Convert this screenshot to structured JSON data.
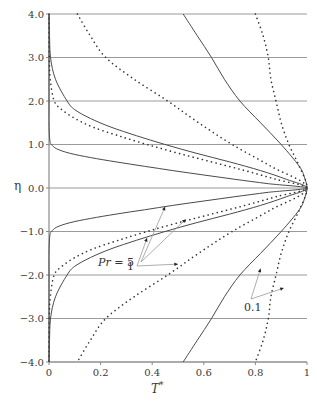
{
  "chart_data": {
    "type": "line",
    "title": "",
    "xlabel": "T*",
    "ylabel": "η",
    "xlim": [
      0,
      1
    ],
    "ylim": [
      -4.0,
      4.0
    ],
    "grid": "horizontal",
    "legend": "none (inline annotations)",
    "x_ticks": [
      "0",
      "0.2",
      "0.4",
      "0.6",
      "0.8",
      "1"
    ],
    "y_ticks": [
      "4.0",
      "3.0",
      "2.0",
      "1.0",
      "0.0",
      "-1.0",
      "-2.0",
      "-3.0",
      "-4.0"
    ],
    "symmetric_about_eta_zero": true,
    "series": [
      {
        "name": "Pr = 5 (solid)",
        "style": "solid",
        "eta_abs": [
          0,
          0.1,
          0.2,
          0.3,
          0.4,
          0.5,
          0.6,
          0.7,
          0.8,
          0.9,
          1.0,
          1.1,
          1.5,
          2.0,
          4.0
        ],
        "T": [
          1.0,
          0.85,
          0.72,
          0.6,
          0.48,
          0.37,
          0.26,
          0.16,
          0.08,
          0.03,
          0.01,
          0.003,
          0.0,
          0.0,
          0.0
        ]
      },
      {
        "name": "Pr = 5 (dotted)",
        "style": "dotted",
        "eta_abs": [
          0,
          0.2,
          0.4,
          0.6,
          0.8,
          1.0,
          1.2,
          1.4,
          1.6,
          1.8,
          2.0,
          2.5,
          3.0,
          4.0
        ],
        "T": [
          1.0,
          0.88,
          0.76,
          0.63,
          0.5,
          0.38,
          0.27,
          0.17,
          0.1,
          0.05,
          0.02,
          0.005,
          0.001,
          0.0
        ]
      },
      {
        "name": "Pr = 1 (solid)",
        "style": "solid",
        "eta_abs": [
          0,
          0.2,
          0.4,
          0.6,
          0.8,
          1.0,
          1.2,
          1.4,
          1.6,
          1.8,
          2.0,
          2.5,
          3.0,
          3.5,
          4.0
        ],
        "T": [
          1.0,
          0.92,
          0.82,
          0.7,
          0.57,
          0.45,
          0.34,
          0.24,
          0.16,
          0.1,
          0.07,
          0.025,
          0.006,
          0.002,
          0.0
        ]
      },
      {
        "name": "Pr = 1 (dotted)",
        "style": "dotted",
        "eta_abs": [
          0,
          0.5,
          1.0,
          1.5,
          2.0,
          2.5,
          3.0,
          3.5,
          4.0
        ],
        "T": [
          1.0,
          0.86,
          0.71,
          0.58,
          0.46,
          0.33,
          0.22,
          0.16,
          0.11
        ]
      },
      {
        "name": "Pr = 0.1 (solid)",
        "style": "solid",
        "eta_abs": [
          0,
          0.25,
          0.5,
          1.0,
          1.5,
          2.0,
          2.5,
          3.0,
          3.5,
          4.0
        ],
        "T": [
          1.0,
          0.99,
          0.97,
          0.9,
          0.82,
          0.74,
          0.68,
          0.63,
          0.575,
          0.52
        ]
      },
      {
        "name": "Pr = 0.1 (dotted)",
        "style": "dotted",
        "eta_abs": [
          0,
          0.5,
          1.0,
          1.5,
          2.0,
          2.5,
          3.0,
          3.5,
          4.0
        ],
        "T": [
          1.0,
          0.97,
          0.93,
          0.9,
          0.88,
          0.86,
          0.85,
          0.83,
          0.8
        ]
      }
    ],
    "annotations": [
      {
        "text": "Pr = 5",
        "label_pos": [
          0.31,
          -0.6
        ],
        "arrows_to": [
          [
            0.45,
            -0.43
          ],
          [
            0.53,
            -0.72
          ]
        ]
      },
      {
        "text": "1",
        "label_pos": [
          0.3,
          -1.75
        ],
        "arrows_to": [
          [
            0.38,
            -1.15
          ],
          [
            0.5,
            -1.75
          ]
        ]
      },
      {
        "text": "0.1",
        "label_pos": [
          0.8,
          -2.5
        ],
        "arrows_to": [
          [
            0.82,
            -1.85
          ],
          [
            0.91,
            -2.3
          ]
        ]
      }
    ]
  },
  "labels": {
    "xlabel_italic": "T",
    "xlabel_sup": "*",
    "ylabel": "η",
    "ann_pr_prefix": "Pr",
    "ann_pr_value": " = 5",
    "ann_1": "1",
    "ann_01": "0.1"
  }
}
